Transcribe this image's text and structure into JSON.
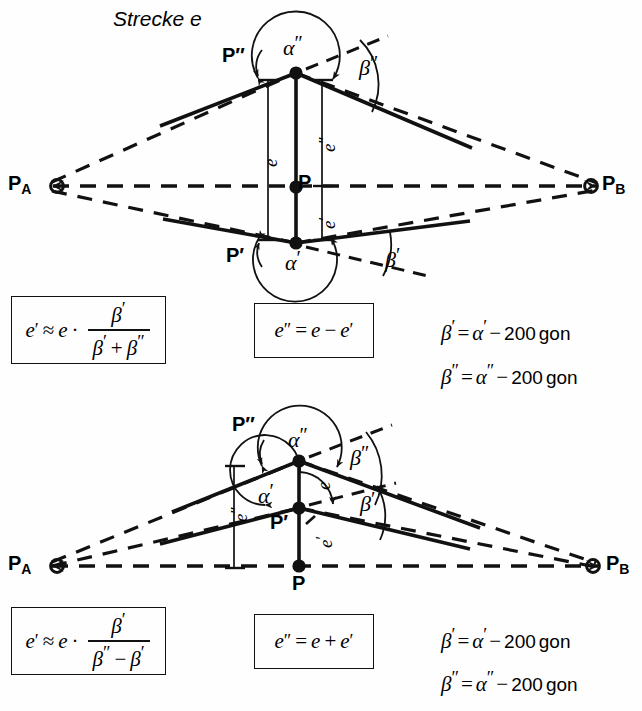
{
  "title": "Strecke e",
  "figure_top": {
    "points": [
      {
        "name": "P_A",
        "label": "P",
        "sub": "A",
        "x": 30,
        "y": 186
      },
      {
        "name": "P_B",
        "label": "P",
        "sub": "B",
        "x": 608,
        "y": 186
      },
      {
        "name": "P_double_prime",
        "label": "P″",
        "x": 296,
        "y": 73
      },
      {
        "name": "P",
        "label": "P",
        "x": 296,
        "y": 187
      },
      {
        "name": "P_prime",
        "label": "P′",
        "x": 296,
        "y": 243
      }
    ],
    "angles": [
      {
        "name": "alpha-double-prime",
        "glyph": "α",
        "prime": "″"
      },
      {
        "name": "beta-double-prime",
        "glyph": "β",
        "prime": "″"
      },
      {
        "name": "alpha-prime",
        "glyph": "α",
        "prime": "′"
      },
      {
        "name": "beta-prime",
        "glyph": "β",
        "prime": "′"
      }
    ],
    "measures": [
      {
        "name": "e",
        "glyph": "e",
        "prime": ""
      },
      {
        "name": "e-double-prime",
        "glyph": "e",
        "prime": "″"
      },
      {
        "name": "e-prime",
        "glyph": "e",
        "prime": "′"
      }
    ]
  },
  "figure_bottom": {
    "points": [
      {
        "name": "P_A",
        "label": "P",
        "sub": "A",
        "x": 30,
        "y": 566
      },
      {
        "name": "P_B",
        "label": "P",
        "sub": "B",
        "x": 612,
        "y": 566
      },
      {
        "name": "P_double_prime",
        "label": "P″",
        "x": 299,
        "y": 461
      },
      {
        "name": "P_prime",
        "label": "P′",
        "x": 299,
        "y": 508
      },
      {
        "name": "P",
        "label": "P",
        "x": 299,
        "y": 566
      }
    ],
    "angles": [
      {
        "name": "alpha-double-prime",
        "glyph": "α",
        "prime": "″"
      },
      {
        "name": "beta-double-prime",
        "glyph": "β",
        "prime": "″"
      },
      {
        "name": "alpha-prime",
        "glyph": "α",
        "prime": "′"
      },
      {
        "name": "beta-prime",
        "glyph": "β",
        "prime": "′"
      }
    ],
    "measures": [
      {
        "name": "e-double-prime",
        "glyph": "e",
        "prime": "″"
      },
      {
        "name": "e",
        "glyph": "e",
        "prime": ""
      },
      {
        "name": "e-prime",
        "glyph": "e",
        "prime": "′"
      }
    ]
  },
  "labels": {
    "P": "P",
    "P_prime": "P′",
    "P_double_prime": "P″",
    "PA_base": "P",
    "PA_sub": "A",
    "PB_base": "P",
    "PB_sub": "B",
    "alpha": "α",
    "beta": "β",
    "e": "e",
    "prime": "′",
    "double_prime": "″"
  },
  "formulas": {
    "top_left": {
      "name": "e-prime-approx-formula",
      "lhs": "e",
      "lhs_prime": "′",
      "approx": "≈",
      "factor": "e",
      "dot": "·",
      "numerator": "β",
      "numerator_prime": "′",
      "denominator_a": "β",
      "denominator_a_prime": "′",
      "denominator_op": "+",
      "denominator_b": "β",
      "denominator_b_prime": "″"
    },
    "top_middle": {
      "name": "e-double-prime-formula",
      "lhs": "e",
      "lhs_prime": "″",
      "eq": "=",
      "term_a": "e",
      "op": "−",
      "term_b": "e",
      "term_b_prime": "′"
    },
    "top_right": [
      {
        "name": "beta-prime-gon-equation",
        "lhs": "β",
        "lhs_prime": "′",
        "eq": "=",
        "rhs": "α",
        "rhs_prime": "′",
        "op": "−",
        "value": "200",
        "unit": "gon"
      },
      {
        "name": "beta-double-prime-gon-equation",
        "lhs": "β",
        "lhs_prime": "″",
        "eq": "=",
        "rhs": "α",
        "rhs_prime": "″",
        "op": "−",
        "value": "200",
        "unit": "gon"
      }
    ],
    "bottom_left": {
      "name": "e-prime-approx-formula",
      "lhs": "e",
      "lhs_prime": "′",
      "approx": "≈",
      "factor": "e",
      "dot": "·",
      "numerator": "β",
      "numerator_prime": "′",
      "denominator_a": "β",
      "denominator_a_prime": "″",
      "denominator_op": "−",
      "denominator_b": "β",
      "denominator_b_prime": "′"
    },
    "bottom_middle": {
      "name": "e-double-prime-formula",
      "lhs": "e",
      "lhs_prime": "″",
      "eq": "=",
      "term_a": "e",
      "op": "+",
      "term_b": "e",
      "term_b_prime": "′"
    },
    "bottom_right": [
      {
        "name": "beta-prime-gon-equation",
        "lhs": "β",
        "lhs_prime": "′",
        "eq": "=",
        "rhs": "α",
        "rhs_prime": "′",
        "op": "−",
        "value": "200",
        "unit": "gon"
      },
      {
        "name": "beta-double-prime-gon-equation",
        "lhs": "β",
        "lhs_prime": "″",
        "eq": "=",
        "rhs": "α",
        "rhs_prime": "″",
        "op": "−",
        "value": "200",
        "unit": "gon"
      }
    ]
  },
  "colors": {
    "ink": "#111111",
    "background": "#fefefe"
  }
}
